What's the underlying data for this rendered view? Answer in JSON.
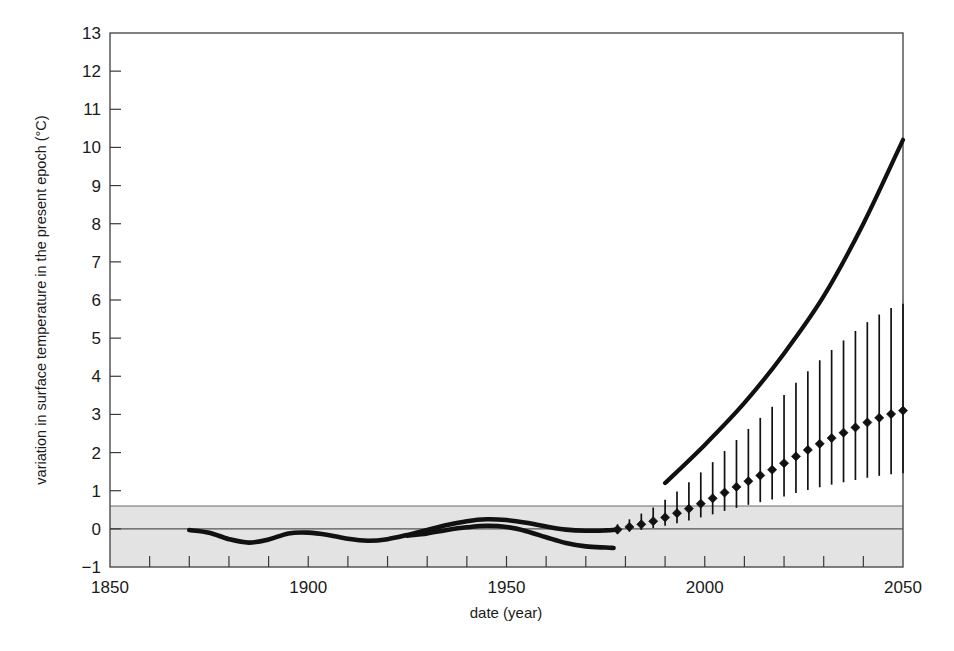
{
  "chart_data": {
    "type": "line",
    "title": "",
    "xlabel": "date (year)",
    "ylabel": "variation in surface temperature in the present epoch (°C)",
    "xlim": [
      1850,
      2050
    ],
    "ylim": [
      -1,
      13
    ],
    "x_tick_step_major": 50,
    "x_tick_step_minor": 10,
    "y_tick_step": 1,
    "grid": false,
    "legend": "none",
    "x_tick_labels": [
      "1850",
      "1900",
      "1950",
      "2000",
      "2050"
    ],
    "x_tick_values": [
      1850,
      1900,
      1950,
      2000,
      2050
    ],
    "y_tick_labels": [
      "13",
      "12",
      "11",
      "10",
      "9",
      "8",
      "7",
      "6",
      "5",
      "4",
      "3",
      "2",
      "1",
      "0",
      "−1"
    ],
    "y_tick_values": [
      13,
      12,
      11,
      10,
      9,
      8,
      7,
      6,
      5,
      4,
      3,
      2,
      1,
      0,
      -1
    ],
    "shaded_band": {
      "label": "natural variability band",
      "y_min": -1,
      "y_max": 0.6,
      "color": "#e3e3e3"
    },
    "zero_line": {
      "label": "zero reference line",
      "y": 0,
      "color": "#555555"
    },
    "series": [
      {
        "name": "observed record (upper)",
        "style": "thick-smooth-curve",
        "color": "#111111",
        "x": [
          1870,
          1875,
          1880,
          1885,
          1890,
          1895,
          1900,
          1905,
          1910,
          1915,
          1920,
          1925,
          1930,
          1935,
          1940,
          1945,
          1950,
          1955,
          1960,
          1965,
          1970,
          1975,
          1978
        ],
        "y": [
          -0.03,
          -0.1,
          -0.27,
          -0.36,
          -0.28,
          -0.12,
          -0.1,
          -0.16,
          -0.26,
          -0.31,
          -0.27,
          -0.16,
          -0.03,
          0.1,
          0.2,
          0.25,
          0.23,
          0.16,
          0.06,
          -0.02,
          -0.05,
          -0.04,
          -0.02
        ]
      },
      {
        "name": "observed record (lower branch)",
        "style": "thick-smooth-curve",
        "color": "#111111",
        "x": [
          1925,
          1930,
          1935,
          1940,
          1945,
          1950,
          1955,
          1960,
          1965,
          1970,
          1975,
          1977
        ],
        "y": [
          -0.18,
          -0.12,
          -0.03,
          0.04,
          0.08,
          0.05,
          -0.06,
          -0.22,
          -0.37,
          -0.46,
          -0.49,
          -0.5
        ]
      },
      {
        "name": "high-end projection",
        "style": "thick-line",
        "color": "#111111",
        "x": [
          1990,
          2000,
          2010,
          2020,
          2030,
          2040,
          2050
        ],
        "y": [
          1.2,
          2.2,
          3.3,
          4.6,
          6.1,
          8.0,
          10.2
        ]
      },
      {
        "name": "best-estimate projection with uncertainty range",
        "style": "diamond-markers-with-error-bars",
        "color": "#111111",
        "x": [
          1978,
          1981,
          1984,
          1987,
          1990,
          1993,
          1996,
          1999,
          2002,
          2005,
          2008,
          2011,
          2014,
          2017,
          2020,
          2023,
          2026,
          2029,
          2032,
          2035,
          2038,
          2041,
          2044,
          2047,
          2050
        ],
        "y": [
          -0.02,
          0.05,
          0.12,
          0.2,
          0.3,
          0.41,
          0.53,
          0.66,
          0.8,
          0.95,
          1.1,
          1.25,
          1.4,
          1.55,
          1.72,
          1.9,
          2.07,
          2.23,
          2.38,
          2.52,
          2.66,
          2.79,
          2.91,
          3.01,
          3.1
        ],
        "yerr_low": [
          0.1,
          0.12,
          0.15,
          0.18,
          0.22,
          0.26,
          0.31,
          0.36,
          0.42,
          0.48,
          0.55,
          0.62,
          0.7,
          0.78,
          0.87,
          0.96,
          1.05,
          1.14,
          1.22,
          1.3,
          1.38,
          1.45,
          1.52,
          1.58,
          1.64
        ],
        "yerr_high": [
          0.14,
          0.2,
          0.28,
          0.36,
          0.46,
          0.57,
          0.69,
          0.82,
          0.95,
          1.09,
          1.23,
          1.37,
          1.51,
          1.65,
          1.79,
          1.93,
          2.06,
          2.19,
          2.31,
          2.42,
          2.53,
          2.63,
          2.71,
          2.78,
          2.8
        ]
      }
    ]
  }
}
